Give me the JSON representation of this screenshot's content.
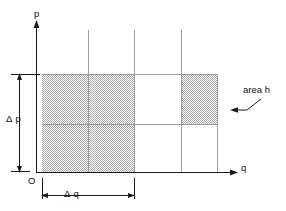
{
  "figure": {
    "type": "phase-space-cell-diagram",
    "axes": {
      "vertical": {
        "label": "p",
        "name": "momentum-axis",
        "origin_label": "O"
      },
      "horizontal": {
        "label": "q",
        "name": "position-axis"
      }
    },
    "dimension_labels": {
      "delta_p": "Δ p",
      "delta_q": "Δ q"
    },
    "annotation": {
      "text": "area h",
      "points_to": "shaded-cell-top-right"
    },
    "colors": {
      "ink": "#1a1a1a",
      "grid": "#9a9a9a",
      "shade": "#c6c6c6",
      "background": "#ffffff"
    },
    "grid": {
      "x_lines": [
        42,
        88,
        134,
        181,
        217
      ],
      "y_lines": [
        74,
        124,
        172
      ],
      "cells_shaded": [
        {
          "col": 0,
          "row": 0
        },
        {
          "col": 1,
          "row": 0
        },
        {
          "col": 0,
          "row": 1
        },
        {
          "col": 1,
          "row": 1
        },
        {
          "col": 3,
          "row": 0
        }
      ]
    }
  }
}
